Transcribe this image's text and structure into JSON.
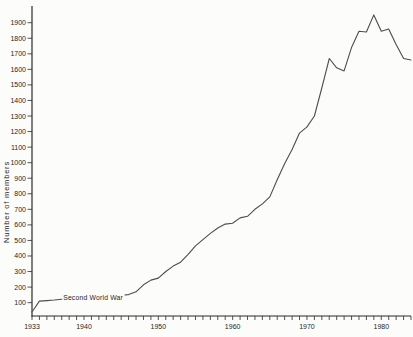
{
  "figure": {
    "ylabel": "Number of members",
    "annotation_label": "Second World War"
  },
  "chart_data": {
    "type": "line",
    "title": "",
    "xlabel": "",
    "ylabel": "Number of members",
    "xlim": [
      1933,
      1984
    ],
    "ylim": [
      0,
      1950
    ],
    "grid": false,
    "legend": "none",
    "x_tick_labels": [
      "1933",
      "1940",
      "1950",
      "1960",
      "1970",
      "1980"
    ],
    "x_tick_years": [
      1933,
      1940,
      1950,
      1960,
      1970,
      1980
    ],
    "minor_x_tick_interval_years": 1,
    "y_tick_values": [
      100,
      200,
      300,
      400,
      500,
      600,
      700,
      800,
      900,
      1000,
      1100,
      1200,
      1300,
      1400,
      1500,
      1600,
      1700,
      1800,
      1900
    ],
    "line_color": "#4d4d4d",
    "axis_color": "#2b2b2b",
    "annotation": {
      "text": "Second World War",
      "year_start": 1938,
      "year_end": 1946,
      "value_level": 130
    },
    "x": [
      1933,
      1934,
      1935,
      1936,
      1937,
      1938,
      1939,
      1940,
      1941,
      1942,
      1943,
      1944,
      1945,
      1946,
      1947,
      1948,
      1949,
      1950,
      1951,
      1952,
      1953,
      1954,
      1955,
      1956,
      1957,
      1958,
      1959,
      1960,
      1961,
      1962,
      1963,
      1964,
      1965,
      1966,
      1967,
      1968,
      1969,
      1970,
      1971,
      1972,
      1973,
      1974,
      1975,
      1976,
      1977,
      1978,
      1979,
      1980,
      1981,
      1982,
      1983,
      1984
    ],
    "values": [
      40,
      110,
      113,
      117,
      122,
      128,
      131,
      133,
      135,
      137,
      140,
      143,
      147,
      152,
      170,
      215,
      245,
      258,
      300,
      335,
      360,
      410,
      465,
      505,
      545,
      580,
      605,
      610,
      645,
      655,
      700,
      735,
      780,
      890,
      995,
      1085,
      1190,
      1230,
      1300,
      1480,
      1670,
      1610,
      1590,
      1740,
      1845,
      1840,
      1950,
      1845,
      1860,
      1760,
      1670,
      1660
    ]
  }
}
